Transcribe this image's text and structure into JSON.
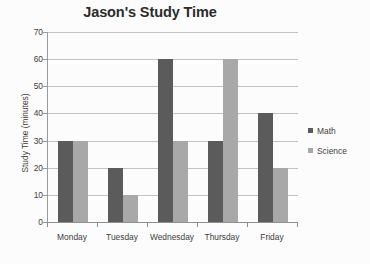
{
  "chart_data": {
    "type": "bar",
    "title": "Jason's Study Time",
    "xlabel": "",
    "ylabel": "Study Time (minutes)",
    "categories": [
      "Monday",
      "Tuesday",
      "Wednesday",
      "Thursday",
      "Friday"
    ],
    "series": [
      {
        "name": "Math",
        "color": "#5b5b5b",
        "values": [
          30,
          20,
          60,
          30,
          40
        ]
      },
      {
        "name": "Science",
        "color": "#a8a8a8",
        "values": [
          30,
          10,
          30,
          60,
          20
        ]
      }
    ],
    "ylim": [
      0,
      70
    ],
    "yticks": [
      0,
      10,
      20,
      30,
      40,
      50,
      60,
      70
    ],
    "ytick_labels": [
      "0",
      "10",
      "20",
      "30",
      "40",
      "50",
      "60",
      "70"
    ],
    "grid": true,
    "legend_position": "right"
  }
}
